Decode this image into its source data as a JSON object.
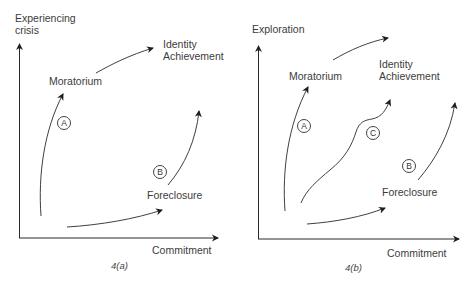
{
  "panels": [
    {
      "id": "4a",
      "caption": "4(a)",
      "y_axis_label_line1": "Experiencing",
      "y_axis_label_line2": "crisis",
      "x_axis_label": "Commitment",
      "states": {
        "moratorium": "Moratorium",
        "identity_line1": "Identity",
        "identity_line2": "Achievement",
        "foreclosure": "Foreclosure"
      },
      "paths": [
        {
          "marker": "A",
          "description": "origin to Moratorium"
        },
        {
          "marker": "B",
          "description": "Foreclosure upward"
        }
      ]
    },
    {
      "id": "4b",
      "caption": "4(b)",
      "y_axis_label": "Exploration",
      "x_axis_label": "Commitment",
      "states": {
        "moratorium": "Moratorium",
        "identity_line1": "Identity",
        "identity_line2": "Achievement",
        "foreclosure": "Foreclosure"
      },
      "paths": [
        {
          "marker": "A",
          "description": "origin to Moratorium"
        },
        {
          "marker": "C",
          "description": "origin directly toward Identity Achievement"
        },
        {
          "marker": "B",
          "description": "Foreclosure upward"
        }
      ]
    }
  ],
  "colors": {
    "line": "#2a2a2a",
    "text": "#3c3c3c",
    "background": "#ffffff"
  }
}
